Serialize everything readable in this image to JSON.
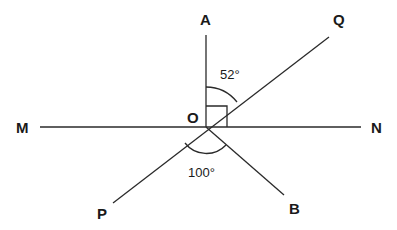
{
  "diagram": {
    "type": "geometry-angles",
    "center": {
      "label": "O"
    },
    "points": {
      "A": "A",
      "Q": "Q",
      "M": "M",
      "N": "N",
      "P": "P",
      "B": "B"
    },
    "angles": {
      "AOQ": "52°",
      "POB": "100°",
      "AON": "right angle"
    },
    "colors": {
      "line": "#2a2a2a",
      "text": "#1a1a1a",
      "background": "#ffffff"
    }
  }
}
